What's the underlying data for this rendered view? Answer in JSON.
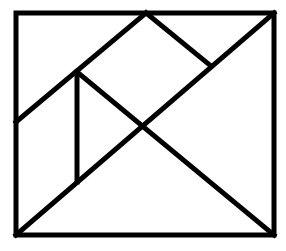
{
  "diagram": {
    "type": "tangram-rectangle",
    "background": "#ffffff",
    "stroke_color": "#000000",
    "stroke_width": 5,
    "frame": {
      "x1": 16,
      "y1": 13,
      "x2": 274,
      "y2": 235
    },
    "segments": [
      {
        "name": "main-diagonal",
        "x1": 16,
        "y1": 235,
        "x2": 274,
        "y2": 13
      },
      {
        "name": "upper-left-diagonal",
        "x1": 16,
        "y1": 122,
        "x2": 146,
        "y2": 13
      },
      {
        "name": "apex-to-main-diagonal",
        "x1": 146,
        "y1": 13,
        "x2": 211,
        "y2": 66
      },
      {
        "name": "cross-diagonal",
        "x1": 77,
        "y1": 72,
        "x2": 274,
        "y2": 235
      },
      {
        "name": "vertical-segment",
        "x1": 77,
        "y1": 72,
        "x2": 77,
        "y2": 182
      }
    ]
  }
}
